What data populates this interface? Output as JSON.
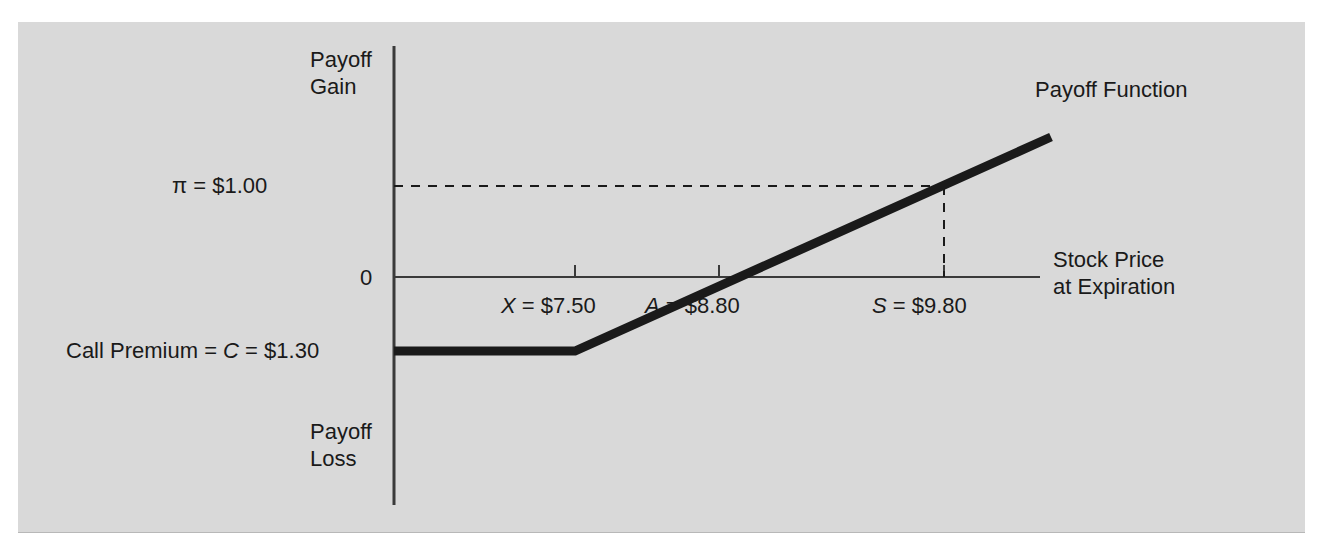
{
  "figure": {
    "background_color": "#d9d9d9",
    "line_color": "#1a1a1a",
    "axis_color": "#3a3a3a"
  },
  "labels": {
    "y_axis_top": "Payoff\nGain",
    "y_axis_bottom": "Payoff\nLoss",
    "x_axis": "Stock Price\nat Expiration",
    "zero": "0",
    "profit": "π = $1.00",
    "call_premium": "Call Premium = C = $1.30",
    "payoff_function": "Payoff Function"
  },
  "ticks": [
    {
      "id": "strike",
      "label": "X = $7.50",
      "value": 7.5
    },
    {
      "id": "breakeven",
      "label": "A = $8.80",
      "value": 8.8
    },
    {
      "id": "stock_price",
      "label": "S = $9.80",
      "value": 9.8
    }
  ],
  "chart_data": {
    "type": "line",
    "title": "",
    "xlabel": "Stock Price at Expiration",
    "ylabel": "Payoff",
    "x": [
      6.0,
      7.5,
      8.8,
      9.8,
      10.3
    ],
    "y": [
      -1.3,
      -1.3,
      0.0,
      1.0,
      1.5
    ],
    "series": [
      {
        "name": "Payoff Function",
        "values": [
          -1.3,
          -1.3,
          0.0,
          1.0,
          1.5
        ],
        "note": "Long call payoff: flat at -C below strike, slope 1 above strike"
      }
    ],
    "annotations": [
      {
        "name": "call-premium",
        "label": "Call Premium = C = $1.30",
        "y": -1.3
      },
      {
        "name": "profit",
        "label": "π = $1.00",
        "y": 1.0
      },
      {
        "name": "strike",
        "label": "X = $7.50",
        "x": 7.5
      },
      {
        "name": "breakeven",
        "label": "A = $8.80",
        "x": 8.8
      },
      {
        "name": "stock-price",
        "label": "S = $9.80",
        "x": 9.8
      }
    ],
    "grid": false,
    "legend": "none",
    "xlim": [
      6.0,
      10.3
    ],
    "ylim": [
      -2.6,
      2.3
    ]
  }
}
